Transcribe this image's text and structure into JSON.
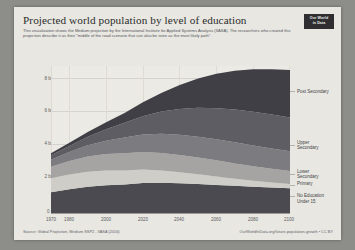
{
  "header": {
    "title": "Projected world population by level of education",
    "subtitle": "This visualization shows the Medium projection by the International Institute for Applied Systems Analysis (IIASA). The researchers who created this projection describe it as their \"middle of the road scenario that can also be seen as the most likely path\".",
    "logo_line1": "Our World",
    "logo_line2": "in Data"
  },
  "footer": {
    "source": "Source: Global Projection, Medium SSP2 - IIASA (2016)",
    "credit": "OurWorldInData.org/future-population-growth • CC BY"
  },
  "axes": {
    "y_ticks": [
      "2 billion",
      "4 billion",
      "6 billion",
      "8 billion"
    ],
    "y_zero": "0",
    "x_ticks": [
      "1970",
      "1980",
      "2000",
      "2020",
      "2040",
      "2060",
      "2080",
      "2100"
    ]
  },
  "legend": [
    {
      "label": "Post Secondary",
      "color": "#3f3f45"
    },
    {
      "label": "Upper\nSecondary",
      "color": "#5d5d63"
    },
    {
      "label": "Lower\nSecondary",
      "color": "#7b7b80"
    },
    {
      "label": "Primary",
      "color": "#a5a4a2"
    },
    {
      "label": "No Education",
      "color": "#cfcdc7"
    },
    {
      "label": "Under 15",
      "color": "#4a4a50"
    }
  ],
  "chart_data": {
    "type": "area",
    "title": "Projected world population by level of education",
    "subtitle": "This visualization shows the Medium projection by the International Institute for Applied Systems Analysis (IIASA). The researchers who created this projection describe it as their \"middle of the road scenario that can also be seen as the most likely path\".",
    "xlabel": "",
    "ylabel": "Population",
    "xlim": [
      1970,
      2100
    ],
    "ylim": [
      0,
      9000000000
    ],
    "y_tick_values": [
      2000000000,
      4000000000,
      6000000000,
      8000000000
    ],
    "x_tick_values": [
      1970,
      1980,
      2000,
      2020,
      2040,
      2060,
      2080,
      2100
    ],
    "grid": true,
    "legend_position": "right",
    "stacked": true,
    "x": [
      1970,
      1980,
      1990,
      2000,
      2010,
      2020,
      2030,
      2040,
      2050,
      2060,
      2070,
      2080,
      2090,
      2100
    ],
    "series": [
      {
        "name": "Under 15",
        "color": "#4a4a50",
        "values_billions": [
          1.37,
          1.56,
          1.72,
          1.8,
          1.85,
          1.95,
          1.97,
          1.94,
          1.89,
          1.83,
          1.77,
          1.71,
          1.66,
          1.62
        ]
      },
      {
        "name": "No Education",
        "color": "#cfcdc7",
        "values_billions": [
          0.88,
          0.92,
          0.94,
          0.93,
          0.89,
          0.84,
          0.77,
          0.69,
          0.61,
          0.53,
          0.45,
          0.38,
          0.32,
          0.27
        ]
      },
      {
        "name": "Primary",
        "color": "#a5a4a2",
        "values_billions": [
          0.72,
          0.85,
          0.96,
          1.04,
          1.08,
          1.1,
          1.1,
          1.08,
          1.05,
          1.01,
          0.96,
          0.91,
          0.86,
          0.81
        ]
      },
      {
        "name": "Lower Secondary",
        "color": "#7b7b80",
        "values_billions": [
          0.44,
          0.56,
          0.7,
          0.84,
          0.98,
          1.1,
          1.2,
          1.27,
          1.31,
          1.33,
          1.33,
          1.31,
          1.28,
          1.25
        ]
      },
      {
        "name": "Upper Secondary",
        "color": "#5d5d63",
        "values_billions": [
          0.28,
          0.39,
          0.54,
          0.72,
          0.93,
          1.16,
          1.4,
          1.62,
          1.81,
          1.95,
          2.05,
          2.11,
          2.13,
          2.12
        ]
      },
      {
        "name": "Post Secondary",
        "color": "#3f3f45",
        "values_billions": [
          0.12,
          0.19,
          0.29,
          0.43,
          0.62,
          0.87,
          1.17,
          1.5,
          1.84,
          2.16,
          2.44,
          2.67,
          2.85,
          2.98
        ]
      }
    ],
    "totals_billions": [
      3.7,
      4.45,
      5.27,
      5.76,
      6.35,
      7.02,
      7.61,
      8.1,
      8.51,
      8.81,
      9.0,
      9.09,
      9.1,
      9.05
    ]
  }
}
